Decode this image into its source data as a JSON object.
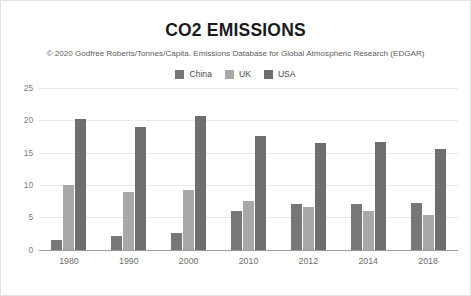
{
  "chart_data": {
    "type": "bar",
    "title": "CO2 EMISSIONS",
    "subtitle": "© 2020 Godfree Roberts/Tonnes/Capita. Emissions Database for Global Atmospheric Research (EDGAR)",
    "xlabel": "",
    "ylabel": "",
    "ylim": [
      0,
      25
    ],
    "yticks": [
      0,
      5,
      10,
      15,
      20,
      25
    ],
    "ytick_labels": [
      "0",
      "5",
      "10",
      "15",
      "20",
      "25"
    ],
    "grid": true,
    "legend_position": "top-center",
    "categories": [
      "1980",
      "1990",
      "2000",
      "2010",
      "2012",
      "2014",
      "2018"
    ],
    "series": [
      {
        "name": "China",
        "color": "#777777",
        "values": [
          1.5,
          2.1,
          2.6,
          6.0,
          7.0,
          7.0,
          7.3
        ]
      },
      {
        "name": "UK",
        "color": "#a8a8a8",
        "values": [
          10.0,
          9.0,
          9.2,
          7.6,
          6.6,
          6.0,
          5.3
        ]
      },
      {
        "name": "USA",
        "color": "#6e6e6e",
        "values": [
          20.2,
          19.0,
          20.6,
          17.6,
          16.5,
          16.6,
          15.6
        ]
      }
    ]
  },
  "legend": {
    "items": [
      {
        "label": "China",
        "color": "#777777"
      },
      {
        "label": "UK",
        "color": "#a8a8a8"
      },
      {
        "label": "USA",
        "color": "#6e6e6e"
      }
    ]
  }
}
